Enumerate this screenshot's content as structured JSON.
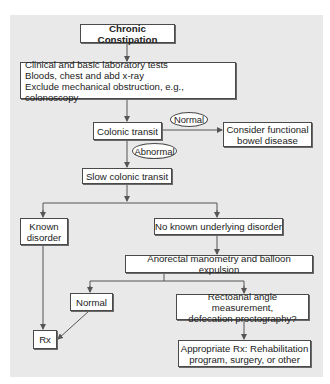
{
  "diagram": {
    "title": "Chronic Constipation",
    "nodes": {
      "start": "Chronic Constipation",
      "clinical": "Clinical and basic laboratory tests\nBloods, chest and abd x-ray\nExclude mechanical obstruction, e.g., colonoscopy",
      "colonic_transit": "Colonic transit",
      "functional": "Consider functional\nbowel disease",
      "slow_transit": "Slow colonic transit",
      "known_disorder": "Known\ndisorder",
      "no_known": "No known underlying disorder",
      "anorectal": "Anorectal manometry and balloon expulsion",
      "normal_result": "Normal",
      "rectoanal": "Rectoanal angle measurement,\ndefecation proctography?",
      "rx": "Rx",
      "appropriate_rx": "Appropriate Rx: Rehabilitation\nprogram, surgery, or other"
    },
    "edge_labels": {
      "normal": "Normal",
      "abnormal": "Abnormal"
    },
    "colors": {
      "background_panel": "#e9e9e9",
      "box_fill": "#ffffff",
      "line": "#555555"
    }
  }
}
